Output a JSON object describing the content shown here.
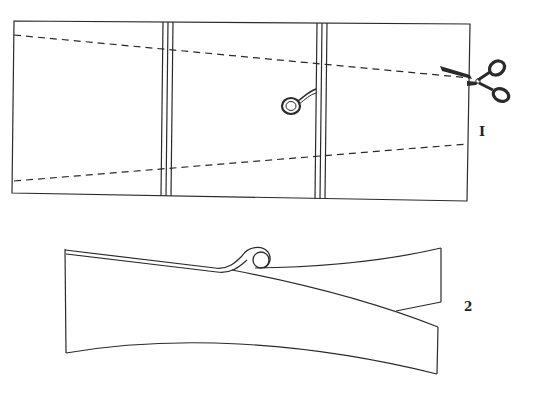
{
  "figure": {
    "step_labels": [
      "I",
      "2"
    ]
  },
  "panel_1": {
    "label": "I",
    "description": "Flat rectangular band with two vertical double-line seams, two diagonal dashed cutting lines, a small curl near the center seam, and scissors at the right edge"
  },
  "panel_2": {
    "label": "2",
    "description": "Band cut along the dashed lines; the strip rolls into a curl at the top while the right end splits apart"
  },
  "colors": {
    "line": "#2a2a2a",
    "background": "#ffffff"
  },
  "icons": [
    "scissors-icon",
    "curl-icon"
  ]
}
